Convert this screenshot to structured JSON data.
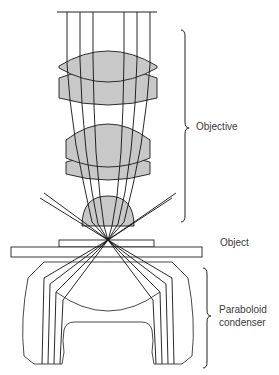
{
  "diagram": {
    "title_cutoff": "(top caption cut off)",
    "labels": {
      "objective": "Objective",
      "object": "Object",
      "condenser_line1": "Paraboloid",
      "condenser_line2": "condenser"
    },
    "colors": {
      "lens_fill": "#c8c8c8",
      "stroke": "#1a1a1a",
      "outline": "#333333",
      "text": "#3a3a3a"
    },
    "components": [
      "parallel-incident-rays",
      "objective-lens-doublet-upper",
      "objective-lens-doublet-middle",
      "hemispherical-front-lens",
      "cover-slip",
      "microscope-slide",
      "paraboloid-condenser",
      "dark-field-oblique-rays"
    ]
  }
}
